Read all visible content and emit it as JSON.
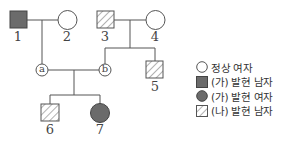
{
  "colors": {
    "line": "#555555",
    "affected_fill": "#6b6b6b",
    "normal_fill": "#ffffff",
    "hatch": "#555555"
  },
  "individuals": [
    {
      "id": "1",
      "sex": "male",
      "phenotype": "ga_affected"
    },
    {
      "id": "2",
      "sex": "female",
      "phenotype": "normal"
    },
    {
      "id": "3",
      "sex": "male",
      "phenotype": "na_affected"
    },
    {
      "id": "4",
      "sex": "female",
      "phenotype": "normal"
    },
    {
      "id": "5",
      "sex": "male",
      "phenotype": "na_affected"
    },
    {
      "id": "6",
      "sex": "male",
      "phenotype": "na_affected"
    },
    {
      "id": "7",
      "sex": "female",
      "phenotype": "ga_affected"
    }
  ],
  "markers": {
    "a": "a",
    "b": "b"
  },
  "labels": {
    "n1": "1",
    "n2": "2",
    "n3": "3",
    "n4": "4",
    "n5": "5",
    "n6": "6",
    "n7": "7"
  },
  "legend": [
    {
      "symbol": "circle-open",
      "label": "정상 여자"
    },
    {
      "symbol": "square-filled",
      "label": "(가) 발현 남자"
    },
    {
      "symbol": "circle-filled",
      "label": "(가) 발현 여자"
    },
    {
      "symbol": "square-hatched",
      "label": "(나) 발현 남자"
    }
  ]
}
